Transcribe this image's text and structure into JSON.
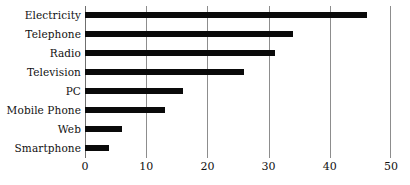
{
  "chart_data": {
    "type": "bar",
    "orientation": "horizontal",
    "title": "",
    "subtitle": "",
    "xlabel": "",
    "ylabel": "",
    "xlim": [
      0,
      50
    ],
    "xticks": [
      0,
      10,
      20,
      30,
      40,
      50
    ],
    "xtick_labels": [
      "0",
      "10",
      "20",
      "30",
      "40",
      "50"
    ],
    "grid": "vertical",
    "legend": "none",
    "bar_color": "#0a0a0a",
    "gridline_color": "#8d8d8d",
    "background": "#ffffff",
    "categories": [
      "Electricity",
      "Telephone",
      "Radio",
      "Television",
      "PC",
      "Mobile Phone",
      "Web",
      "Smartphone"
    ],
    "values": [
      46,
      34,
      31,
      26,
      16,
      13,
      6,
      4
    ],
    "series": [
      {
        "name": "",
        "values": [
          46,
          34,
          31,
          26,
          16,
          13,
          6,
          4
        ]
      }
    ]
  }
}
